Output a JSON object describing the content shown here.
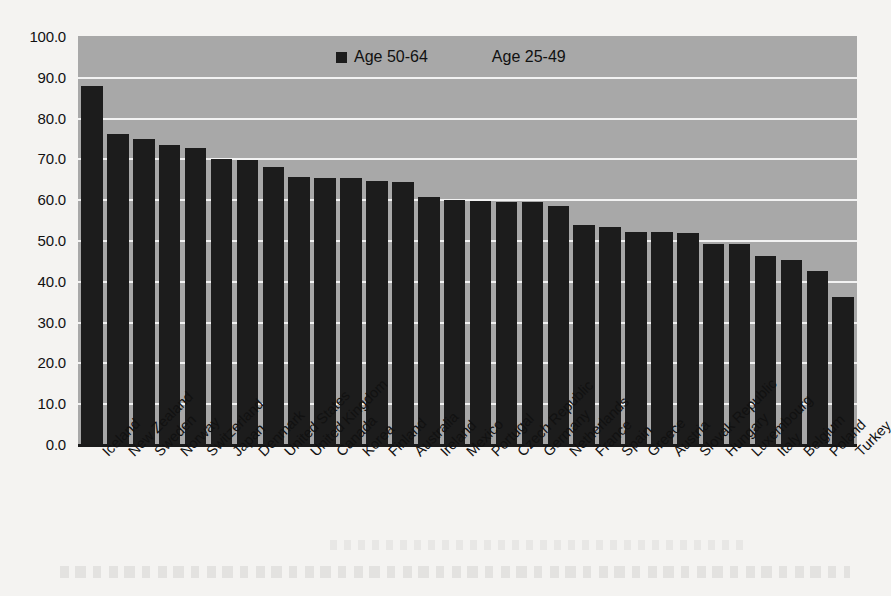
{
  "chart_data": {
    "type": "bar",
    "title": "",
    "subtitle": "",
    "xlabel": "",
    "ylabel": "",
    "ylim": [
      0.0,
      100.0
    ],
    "ytick_step": 10.0,
    "grid": true,
    "grid_axis": "y",
    "legend_position": "top-center",
    "bar_color": "#1c1c1c",
    "plot_background": "#a8a8a8",
    "gridline_color": "#f2f2f2",
    "ytick_labels": [
      "100.0",
      "90.0",
      "80.0",
      "70.0",
      "60.0",
      "50.0",
      "40.0",
      "30.0",
      "20.0",
      "10.0",
      "0.0"
    ],
    "legend": [
      {
        "label": "Age 50-64",
        "marker": "square",
        "color": "#1c1c1c",
        "visible_marker": true
      },
      {
        "label": "Age 25-49",
        "marker": "square",
        "color": "#a8a8a8",
        "visible_marker": false
      }
    ],
    "categories": [
      "Iceland",
      "New Zealand",
      "Sweden",
      "Norway",
      "Switzerland",
      "Japan",
      "Denmark",
      "United States",
      "United Kingdom",
      "Canada",
      "Korea",
      "Finland",
      "Australia",
      "Ireland",
      "Mexico",
      "Portugal",
      "Czech Republic",
      "Germany",
      "Netherlands",
      "France",
      "Spain",
      "Greece",
      "Austria",
      "Slovak Republic",
      "Hungary",
      "Luxembourg",
      "Italy",
      "Belgium",
      "Poland",
      "Turkey"
    ],
    "series": [
      {
        "name": "Age 50-64",
        "values": [
          87.8,
          76.0,
          74.8,
          73.3,
          72.5,
          69.8,
          69.5,
          68.0,
          65.5,
          65.3,
          65.2,
          64.5,
          64.3,
          60.5,
          59.8,
          59.5,
          59.3,
          59.2,
          58.3,
          53.8,
          53.3,
          52.0,
          52.0,
          51.8,
          49.0,
          49.0,
          46.0,
          45.0,
          42.5,
          36.0
        ]
      }
    ]
  }
}
